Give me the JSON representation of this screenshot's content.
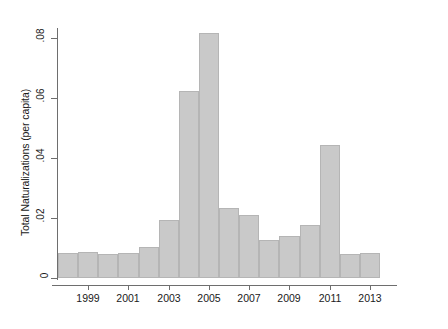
{
  "chart_data": {
    "type": "bar",
    "title": "",
    "subtitle": "",
    "xlabel": "",
    "ylabel": "Total Naturalizations (per capita)",
    "categories": [
      "1998",
      "1999",
      "2000",
      "2001",
      "2002",
      "2003",
      "2004",
      "2005",
      "2006",
      "2007",
      "2008",
      "2009",
      "2010",
      "2011",
      "2012",
      "2013"
    ],
    "values": [
      0.0085,
      0.0088,
      0.008,
      0.0085,
      0.0105,
      0.0193,
      0.0625,
      0.0818,
      0.0232,
      0.021,
      0.0128,
      0.014,
      0.0178,
      0.0443,
      0.008,
      0.0085
    ],
    "ylim": [
      0,
      0.085
    ],
    "xlim": [
      1997.5,
      2013.5
    ],
    "ytick_values": [
      0,
      0.02,
      0.04,
      0.06,
      0.08
    ],
    "ytick_labels": [
      "0",
      ".02",
      ".04",
      ".06",
      ".08"
    ],
    "xtick_values": [
      1999,
      2001,
      2003,
      2005,
      2007,
      2009,
      2011,
      2013
    ],
    "xtick_labels": [
      "1999",
      "2001",
      "2003",
      "2005",
      "2007",
      "2009",
      "2011",
      "2013"
    ],
    "grid": false,
    "legend": null,
    "bar_color": "#c9c9c9",
    "bar_edge_color": "#b5b5b5",
    "axis_color": "#6e6e6e",
    "background_color": "#ffffff"
  }
}
